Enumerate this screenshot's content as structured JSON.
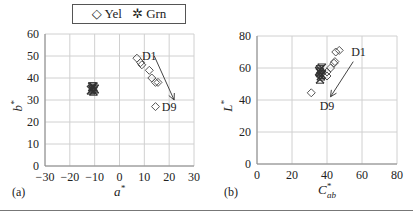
{
  "legend": {
    "items": [
      {
        "symbol": "◇",
        "label": "Yel",
        "marker": "diamond-open"
      },
      {
        "symbol": "⌘",
        "label": "Grn",
        "marker": "star"
      }
    ]
  },
  "colors": {
    "grid": "#d0d0d0",
    "axis": "#888888",
    "marker": "#555555",
    "grn": "#333333"
  },
  "chart_data": [
    {
      "type": "scatter",
      "panel_label": "(a)",
      "title": "",
      "xlabel": "a*",
      "ylabel": "b*",
      "xlim": [
        -30,
        30
      ],
      "ylim": [
        0,
        60
      ],
      "xticks": [
        -30,
        -20,
        -10,
        0,
        10,
        20,
        30
      ],
      "yticks": [
        0,
        10,
        20,
        30,
        40,
        50,
        60
      ],
      "grid": true,
      "legend_position": "top",
      "series": [
        {
          "name": "Yel",
          "marker": "diamond-open",
          "points": [
            [
              7,
              49
            ],
            [
              8.5,
              47
            ],
            [
              9,
              46
            ],
            [
              12,
              43.5
            ],
            [
              13,
              40
            ],
            [
              14.5,
              38
            ],
            [
              15.5,
              38
            ],
            [
              14.5,
              27
            ]
          ]
        },
        {
          "name": "Grn",
          "marker": "star",
          "points": [
            [
              -11,
              35
            ],
            [
              -10.5,
              36
            ],
            [
              -11.5,
              34.5
            ],
            [
              -10,
              35
            ],
            [
              -11,
              36
            ],
            [
              -10.5,
              34
            ]
          ]
        }
      ],
      "annotations": [
        {
          "text": "D1",
          "x": 12,
          "y": 50
        },
        {
          "text": "D9",
          "x": 20,
          "y": 27
        },
        {
          "arrow_from": [
            14,
            50
          ],
          "arrow_to": [
            22,
            30
          ]
        }
      ]
    },
    {
      "type": "scatter",
      "panel_label": "(b)",
      "title": "",
      "xlabel": "C*ab",
      "ylabel": "L*",
      "xlim": [
        0,
        80
      ],
      "ylim": [
        0,
        80
      ],
      "xticks": [
        0,
        20,
        40,
        60,
        80
      ],
      "yticks": [
        0,
        20,
        40,
        60,
        80
      ],
      "grid": true,
      "series": [
        {
          "name": "Yel",
          "marker": "diamond-open",
          "points": [
            [
              31,
              44.5
            ],
            [
              45,
              70
            ],
            [
              47,
              71
            ],
            [
              44.5,
              64
            ],
            [
              44,
              63
            ],
            [
              42,
              60
            ],
            [
              40,
              57.5
            ],
            [
              40,
              55
            ]
          ]
        },
        {
          "name": "Grn",
          "marker": "star",
          "points": [
            [
              36,
              57
            ],
            [
              36,
              59
            ],
            [
              37,
              56
            ],
            [
              35.5,
              58
            ],
            [
              36.5,
              55
            ],
            [
              37,
              60
            ],
            [
              36,
              53
            ]
          ]
        }
      ],
      "annotations": [
        {
          "text": "D1",
          "x": 58,
          "y": 70
        },
        {
          "text": "D9",
          "x": 40,
          "y": 36
        },
        {
          "arrow_from": [
            55,
            64
          ],
          "arrow_to": [
            42,
            42
          ]
        }
      ]
    }
  ]
}
